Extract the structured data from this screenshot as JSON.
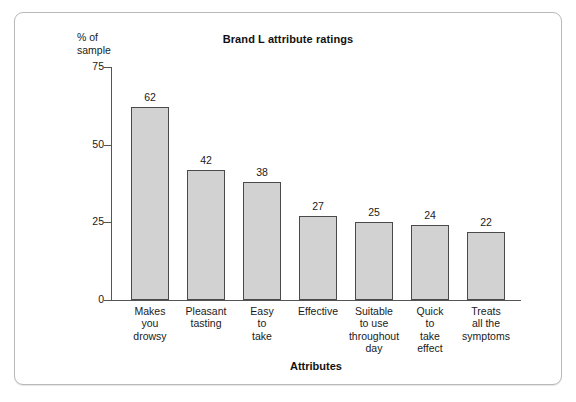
{
  "frame": {
    "border_color": "#b9b9b9",
    "background": "#ffffff"
  },
  "chart_data": {
    "type": "bar",
    "title": "Brand L attribute ratings",
    "xlabel": "Attributes",
    "ylabel": "% of\nsample",
    "ylim": [
      0,
      75
    ],
    "yticks": [
      0,
      25,
      50,
      75
    ],
    "ytick_labels": [
      "0",
      "25",
      "50",
      "75"
    ],
    "grid": false,
    "legend": "none",
    "bar_fill_color": "#d2d2d2",
    "bar_edge_color": "#4a4a4a",
    "categories": [
      "Makes\nyou\ndrowsy",
      "Pleasant\ntasting",
      "Easy\nto\ntake",
      "Effective",
      "Suitable\nto use\nthroughout\nday",
      "Quick\nto\ntake\neffect",
      "Treats\nall the\nsymptoms"
    ],
    "values": [
      62,
      42,
      38,
      27,
      25,
      24,
      22
    ],
    "value_labels": [
      "62",
      "42",
      "38",
      "27",
      "25",
      "24",
      "22"
    ]
  }
}
